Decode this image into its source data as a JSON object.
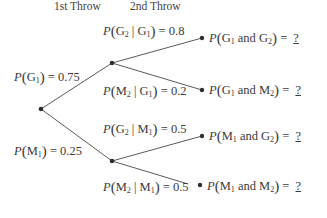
{
  "headers": {
    "first_throw": "1st Throw",
    "second_throw": "2nd Throw"
  },
  "branches": {
    "g1": {
      "event": "G",
      "sub": "1",
      "value": "0.75"
    },
    "m1": {
      "event": "M",
      "sub": "1",
      "value": "0.25"
    },
    "g2_given_g1": {
      "event": "G",
      "sub": "2",
      "given": "G",
      "given_sub": "1",
      "value": "0.8"
    },
    "m2_given_g1": {
      "event": "M",
      "sub": "2",
      "given": "G",
      "given_sub": "1",
      "value": "0.2"
    },
    "g2_given_m1": {
      "event": "G",
      "sub": "2",
      "given": "M",
      "given_sub": "1",
      "value": "0.5"
    },
    "m2_given_m1": {
      "event": "M",
      "sub": "2",
      "given": "M",
      "given_sub": "1",
      "value": "0.5"
    }
  },
  "outcomes": [
    {
      "a": "G",
      "a_sub": "1",
      "conj": "and",
      "b": "G",
      "b_sub": "2",
      "answer": "?"
    },
    {
      "a": "G",
      "a_sub": "1",
      "conj": "and",
      "b": "M",
      "b_sub": "2",
      "answer": "?"
    },
    {
      "a": "M",
      "a_sub": "1",
      "conj": "and",
      "b": "G",
      "b_sub": "2",
      "answer": "?"
    },
    {
      "a": "M",
      "a_sub": "1",
      "conj": "and",
      "b": "M",
      "b_sub": "2",
      "answer": "?"
    }
  ],
  "symbols": {
    "P": "P",
    "open": "(",
    "close": ")",
    "bar": "|",
    "eq": "="
  },
  "colors": {
    "line": "#5a5a5a",
    "node": "#2e2e2e",
    "text": "#3a3a3a"
  }
}
